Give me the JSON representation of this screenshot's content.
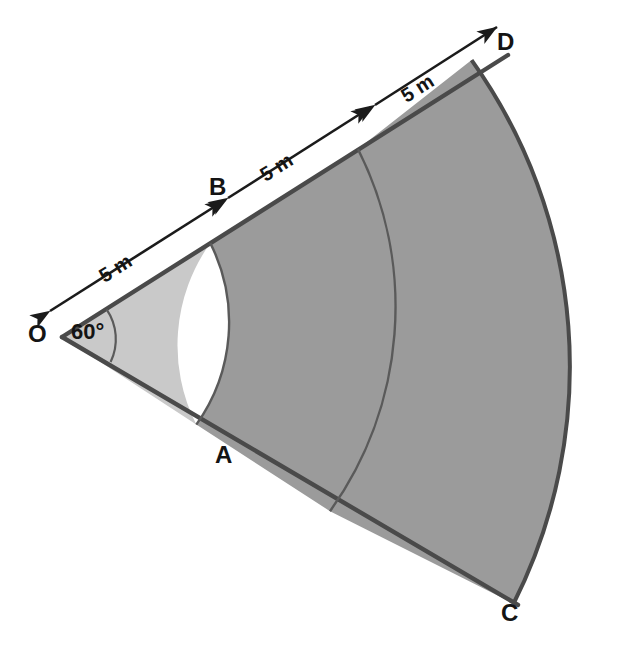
{
  "figure": {
    "type": "sector-diagram",
    "vertex_label": "O",
    "angle_label": "60°",
    "angle_value": 60,
    "angle_unit": "degrees",
    "points": [
      {
        "name": "point-O",
        "label": "O",
        "x": 36,
        "y": 322,
        "role": "sector-vertex"
      },
      {
        "name": "point-B",
        "label": "B",
        "x": 209,
        "y": 175,
        "role": "inner-arc-upper-edge"
      },
      {
        "name": "point-A",
        "label": "A",
        "x": 215,
        "y": 443,
        "role": "inner-arc-lower-edge"
      },
      {
        "name": "point-D",
        "label": "D",
        "x": 497,
        "y": 30,
        "role": "outer-upper-corner"
      },
      {
        "name": "point-C",
        "label": "C",
        "x": 501,
        "y": 601,
        "role": "outer-lower-corner"
      }
    ],
    "dimensions": [
      {
        "name": "segment-O-B",
        "label": "5 m",
        "value": 5,
        "unit": "m",
        "x": 122,
        "y": 268,
        "rotation": -32.3
      },
      {
        "name": "segment-B-mid",
        "label": "5 m",
        "value": 5,
        "unit": "m",
        "x": 283,
        "y": 167,
        "rotation": -32.3
      },
      {
        "name": "segment-mid-D",
        "label": "5 m",
        "value": 5,
        "unit": "m",
        "x": 424,
        "y": 88,
        "rotation": -32.3
      }
    ],
    "radii": {
      "inner": 5,
      "middle": 10,
      "outer": 15,
      "unit": "m"
    },
    "colors": {
      "inner_band_fill": "#c9c9c9",
      "middle_band_fill": "#9b9b9b",
      "outer_band_fill": "#9b9b9b",
      "edge_stroke": "#4a4a4a",
      "arc_stroke": "#5a5a5a",
      "dimension_stroke": "#1b1b1b",
      "label_color": "#141414",
      "background": "#ffffff"
    }
  }
}
